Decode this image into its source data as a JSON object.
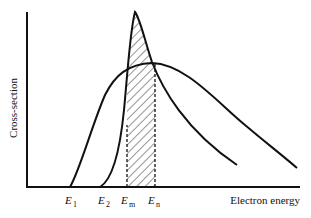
{
  "diagram": {
    "axes": {
      "y_label": "Cross-section",
      "x_label": "Electron energy"
    },
    "energy_markers": [
      {
        "symbol": "E",
        "subscript": "1"
      },
      {
        "symbol": "E",
        "subscript": "2"
      },
      {
        "symbol": "E",
        "subscript": "m"
      },
      {
        "symbol": "E",
        "subscript": "n"
      }
    ],
    "curves": [
      {
        "name": "narrow-resonant-cross-section",
        "onset": "E2",
        "shape": "sharp peak"
      },
      {
        "name": "broad-cross-section",
        "onset": "E1",
        "shape": "broad peak"
      }
    ],
    "shaded_region": {
      "from": "Em",
      "to": "En",
      "style": "hatched"
    },
    "colors": {
      "line": "#111111",
      "background": "#ffffff"
    }
  }
}
